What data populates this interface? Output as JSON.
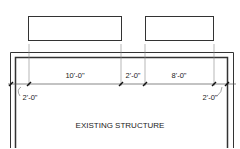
{
  "drawing": {
    "elements": {
      "left_box": {
        "label": "new element (left)"
      },
      "right_box": {
        "label": "new element (right)"
      }
    },
    "dimensions": {
      "d1": "10'-0\"",
      "d2": "2'-0\"",
      "d3": "8'-0\"",
      "left_offset": "2'-0\"",
      "right_offset": "2'-0\""
    },
    "label": "EXISTING STRUCTURE"
  }
}
